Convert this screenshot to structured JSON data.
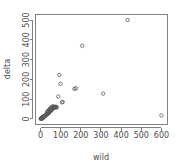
{
  "chart_data": {
    "type": "scatter",
    "title": "",
    "xlabel": "wild",
    "ylabel": "delta",
    "xlim": [
      -25,
      630
    ],
    "ylim": [
      -28,
      528
    ],
    "xticks": [
      0,
      100,
      200,
      300,
      400,
      500,
      600
    ],
    "yticks": [
      0,
      100,
      200,
      300,
      400,
      500
    ],
    "xticklabels": [
      "0",
      "100",
      "200",
      "300",
      "400",
      "500",
      "600"
    ],
    "yticklabels": [
      "0",
      "100",
      "200",
      "300",
      "400",
      "500"
    ],
    "grid": false,
    "legend": false,
    "marker": "open-circle",
    "marker_color": "#5a5a5a",
    "frame_color": "#808080",
    "background": "#ffffff",
    "series": [
      {
        "name": "points",
        "points": [
          [
            2,
            1
          ],
          [
            3,
            2
          ],
          [
            4,
            2
          ],
          [
            5,
            3
          ],
          [
            6,
            4
          ],
          [
            7,
            4
          ],
          [
            8,
            5
          ],
          [
            9,
            6
          ],
          [
            10,
            7
          ],
          [
            11,
            7
          ],
          [
            12,
            8
          ],
          [
            13,
            9
          ],
          [
            14,
            10
          ],
          [
            15,
            10
          ],
          [
            16,
            11
          ],
          [
            17,
            12
          ],
          [
            18,
            13
          ],
          [
            19,
            14
          ],
          [
            20,
            14
          ],
          [
            21,
            15
          ],
          [
            22,
            16
          ],
          [
            23,
            17
          ],
          [
            24,
            18
          ],
          [
            25,
            18
          ],
          [
            26,
            19
          ],
          [
            27,
            20
          ],
          [
            28,
            21
          ],
          [
            29,
            22
          ],
          [
            30,
            23
          ],
          [
            31,
            24
          ],
          [
            33,
            25
          ],
          [
            34,
            26
          ],
          [
            36,
            27
          ],
          [
            37,
            28
          ],
          [
            38,
            30
          ],
          [
            40,
            31
          ],
          [
            42,
            33
          ],
          [
            43,
            34
          ],
          [
            45,
            36
          ],
          [
            47,
            38
          ],
          [
            48,
            40
          ],
          [
            50,
            41
          ],
          [
            52,
            43
          ],
          [
            54,
            45
          ],
          [
            56,
            47
          ],
          [
            58,
            50
          ],
          [
            60,
            52
          ],
          [
            63,
            55
          ],
          [
            66,
            58
          ],
          [
            69,
            60
          ],
          [
            72,
            62
          ],
          [
            75,
            60
          ],
          [
            80,
            58
          ],
          [
            62,
            64
          ],
          [
            58,
            62
          ],
          [
            55,
            59
          ],
          [
            52,
            56
          ],
          [
            49,
            53
          ],
          [
            46,
            50
          ],
          [
            44,
            47
          ],
          [
            41,
            44
          ],
          [
            39,
            42
          ],
          [
            35,
            38
          ],
          [
            32,
            34
          ],
          [
            1,
            1
          ],
          [
            2,
            2
          ],
          [
            3,
            3
          ],
          [
            5,
            5
          ],
          [
            7,
            6
          ],
          [
            9,
            8
          ],
          [
            11,
            10
          ],
          [
            13,
            12
          ],
          [
            6,
            2
          ],
          [
            8,
            3
          ],
          [
            10,
            4
          ],
          [
            12,
            5
          ],
          [
            14,
            6
          ],
          [
            4,
            1
          ],
          [
            88,
            113
          ],
          [
            93,
            222
          ],
          [
            99,
            178
          ],
          [
            106,
            84
          ],
          [
            110,
            86
          ],
          [
            168,
            152
          ],
          [
            176,
            155
          ],
          [
            207,
            370
          ],
          [
            311,
            128
          ],
          [
            432,
            500
          ],
          [
            600,
            18
          ],
          [
            70,
            57
          ],
          [
            74,
            59
          ],
          [
            79,
            61
          ]
        ]
      }
    ]
  },
  "labels": {
    "x_axis_title": "wild",
    "y_axis_title": "delta"
  }
}
